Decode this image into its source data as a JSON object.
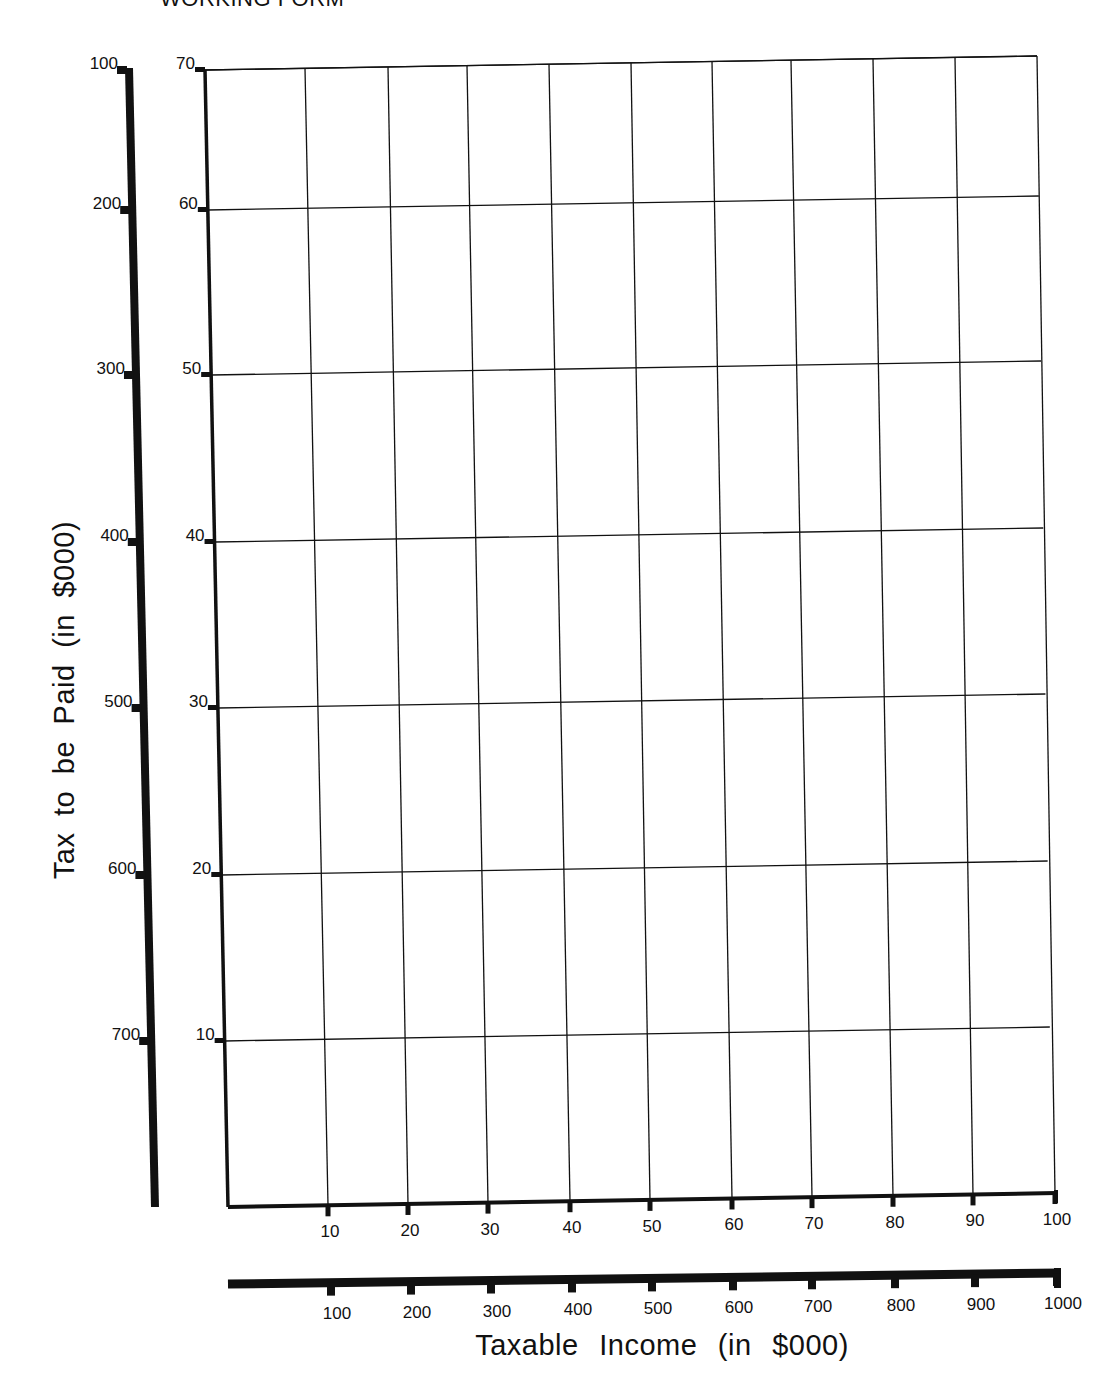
{
  "header": {
    "text": "WORKING FORM"
  },
  "chart_data": {
    "type": "line",
    "title": "",
    "xlabel": "Taxable Income (in $000)",
    "ylabel": "Tax to be Paid (in $000)",
    "series": [],
    "grid": true,
    "x_axes": [
      {
        "name": "inner",
        "ticks": [
          10,
          20,
          30,
          40,
          50,
          60,
          70,
          80,
          90,
          100
        ],
        "range": [
          0,
          100
        ]
      },
      {
        "name": "outer",
        "ticks": [
          100,
          200,
          300,
          400,
          500,
          600,
          700,
          800,
          900,
          1000
        ],
        "range": [
          0,
          1000
        ]
      }
    ],
    "y_axes": [
      {
        "name": "outer",
        "ticks": [
          100,
          200,
          300,
          400,
          500,
          600,
          700
        ],
        "range": [
          0,
          700
        ]
      },
      {
        "name": "inner",
        "ticks": [
          10,
          20,
          30,
          40,
          50,
          60,
          70
        ],
        "range": [
          0,
          70
        ]
      }
    ],
    "xlim": [
      0,
      100
    ],
    "ylim": [
      0,
      70
    ],
    "note": "Blank worksheet graph with dual scales; no data plotted"
  },
  "labels": {
    "x_axis": "Taxable  Income  (in  $000)",
    "y_axis": "Tax  to  be  Paid  (in  $000)"
  },
  "colors": {
    "ink": "#111111",
    "paper": "#ffffff"
  }
}
